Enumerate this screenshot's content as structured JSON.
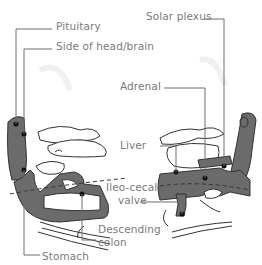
{
  "figure": {
    "labels": {
      "pituitary": "Pituitary",
      "side_of_head": "Side of head/brain",
      "solar_plexus": "Solar plexus",
      "adrenal": "Adrenal",
      "liver": "Liver",
      "ileo_line1": "Ileo-cecal",
      "ileo_line2": "valve",
      "descending_line1": "Descending",
      "descending_line2": "colon",
      "stomach": "Stomach"
    },
    "colors": {
      "text": "#7a7a7a",
      "leader_line": "#6e6e6e",
      "shaded_region": "#6b6b6b",
      "outline": "#333333",
      "point": "#111111"
    }
  }
}
